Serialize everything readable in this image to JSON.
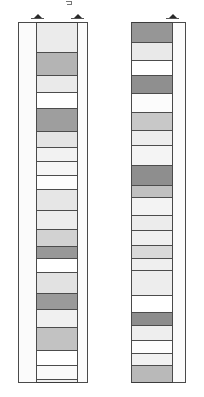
{
  "figure": {
    "background_color": "#ffffff",
    "line_color": "#4a4a4a",
    "panel_count": 2
  },
  "markers": [
    {
      "name": "marker-left-column-left-edge",
      "label": "▲",
      "x": 31,
      "y": 12
    },
    {
      "name": "marker-left-column-right-edge",
      "label": "▲",
      "x": 71,
      "y": 12
    },
    {
      "name": "marker-right-column-right-edge",
      "label": "▲",
      "x": 166,
      "y": 12
    }
  ],
  "stray_mark": {
    "name": "stray-tick",
    "label": "⌐",
    "x": 66,
    "y": 1
  },
  "panels": [
    {
      "name": "left-panel",
      "frame": {
        "x": 18,
        "y": 22,
        "width": 70,
        "height": 361
      },
      "column": {
        "x": 36,
        "y": 22,
        "width": 42,
        "height": 361
      },
      "beds": [
        {
          "label": "bed-1",
          "top": 0,
          "height": 30,
          "fill": "#ebebeb"
        },
        {
          "label": "bed-2",
          "top": 30,
          "height": 23,
          "fill": "#b4b4b4"
        },
        {
          "label": "bed-3",
          "top": 53,
          "height": 17,
          "fill": "#eaeaea"
        },
        {
          "label": "bed-4",
          "top": 70,
          "height": 16,
          "fill": "#ffffff"
        },
        {
          "label": "bed-5",
          "top": 86,
          "height": 23,
          "fill": "#9e9e9e"
        },
        {
          "label": "bed-6",
          "top": 109,
          "height": 16,
          "fill": "#e4e4e4"
        },
        {
          "label": "bed-7",
          "top": 125,
          "height": 14,
          "fill": "#f2f2f2"
        },
        {
          "label": "bed-8",
          "top": 139,
          "height": 14,
          "fill": "#f6f6f6"
        },
        {
          "label": "bed-9",
          "top": 153,
          "height": 14,
          "fill": "#fdfdfd"
        },
        {
          "label": "bed-10",
          "top": 167,
          "height": 21,
          "fill": "#e6e6e6"
        },
        {
          "label": "bed-11",
          "top": 188,
          "height": 19,
          "fill": "#ededed"
        },
        {
          "label": "bed-12",
          "top": 207,
          "height": 17,
          "fill": "#d2d2d2"
        },
        {
          "label": "bed-13",
          "top": 224,
          "height": 12,
          "fill": "#989898"
        },
        {
          "label": "bed-14",
          "top": 236,
          "height": 14,
          "fill": "#ffffff"
        },
        {
          "label": "bed-15",
          "top": 250,
          "height": 21,
          "fill": "#e2e2e2"
        },
        {
          "label": "bed-16",
          "top": 271,
          "height": 16,
          "fill": "#9a9a9a"
        },
        {
          "label": "bed-17",
          "top": 287,
          "height": 18,
          "fill": "#f0f0f0"
        },
        {
          "label": "bed-18",
          "top": 305,
          "height": 23,
          "fill": "#c2c2c2"
        },
        {
          "label": "bed-19",
          "top": 328,
          "height": 15,
          "fill": "#ffffff"
        },
        {
          "label": "bed-20",
          "top": 343,
          "height": 14,
          "fill": "#fafafa"
        },
        {
          "label": "bed-21",
          "top": 357,
          "height": 4,
          "fill": "#efefef"
        }
      ]
    },
    {
      "name": "right-panel",
      "frame": {
        "x": 131,
        "y": 22,
        "width": 55,
        "height": 361
      },
      "column": {
        "x": 131,
        "y": 22,
        "width": 42,
        "height": 361
      },
      "beds": [
        {
          "label": "bed-1",
          "top": 0,
          "height": 20,
          "fill": "#969696"
        },
        {
          "label": "bed-2",
          "top": 20,
          "height": 18,
          "fill": "#e9e9e9"
        },
        {
          "label": "bed-3",
          "top": 38,
          "height": 15,
          "fill": "#ffffff"
        },
        {
          "label": "bed-4",
          "top": 53,
          "height": 18,
          "fill": "#8f8f8f"
        },
        {
          "label": "bed-5",
          "top": 71,
          "height": 19,
          "fill": "#fcfcfc"
        },
        {
          "label": "bed-6",
          "top": 90,
          "height": 18,
          "fill": "#c8c8c8"
        },
        {
          "label": "bed-7",
          "top": 108,
          "height": 15,
          "fill": "#ededed"
        },
        {
          "label": "bed-8",
          "top": 123,
          "height": 20,
          "fill": "#f4f4f4"
        },
        {
          "label": "bed-9",
          "top": 143,
          "height": 20,
          "fill": "#8e8e8e"
        },
        {
          "label": "bed-10",
          "top": 163,
          "height": 12,
          "fill": "#c0c0c0"
        },
        {
          "label": "bed-11",
          "top": 175,
          "height": 18,
          "fill": "#f3f3f3"
        },
        {
          "label": "bed-12",
          "top": 193,
          "height": 15,
          "fill": "#ececec"
        },
        {
          "label": "bed-13",
          "top": 208,
          "height": 15,
          "fill": "#f0f0f0"
        },
        {
          "label": "bed-14",
          "top": 223,
          "height": 13,
          "fill": "#d9d9d9"
        },
        {
          "label": "bed-15",
          "top": 236,
          "height": 12,
          "fill": "#efefef"
        },
        {
          "label": "bed-16",
          "top": 248,
          "height": 25,
          "fill": "#ededed"
        },
        {
          "label": "bed-17",
          "top": 273,
          "height": 17,
          "fill": "#ffffff"
        },
        {
          "label": "bed-18",
          "top": 290,
          "height": 13,
          "fill": "#8d8d8d"
        },
        {
          "label": "bed-19",
          "top": 303,
          "height": 15,
          "fill": "#eeeeee"
        },
        {
          "label": "bed-20",
          "top": 318,
          "height": 13,
          "fill": "#fdfdfd"
        },
        {
          "label": "bed-21",
          "top": 331,
          "height": 12,
          "fill": "#f1f1f1"
        },
        {
          "label": "bed-22",
          "top": 343,
          "height": 17,
          "fill": "#b9b9b9"
        },
        {
          "label": "bed-23",
          "top": 360,
          "height": 1,
          "fill": "#ffffff"
        }
      ]
    }
  ]
}
